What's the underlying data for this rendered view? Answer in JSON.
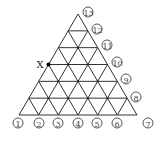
{
  "diagram": {
    "type": "triangular-grid",
    "divisions": 6,
    "marker": {
      "label": "X",
      "row_from_top": 3,
      "side": "left"
    },
    "bottom_labels": [
      "1",
      "2",
      "3",
      "4",
      "5",
      "6",
      "7"
    ],
    "right_labels": [
      "8",
      "9",
      "10",
      "11",
      "12",
      "13"
    ],
    "colors": {
      "line": "#333333",
      "background": "#ffffff"
    }
  }
}
